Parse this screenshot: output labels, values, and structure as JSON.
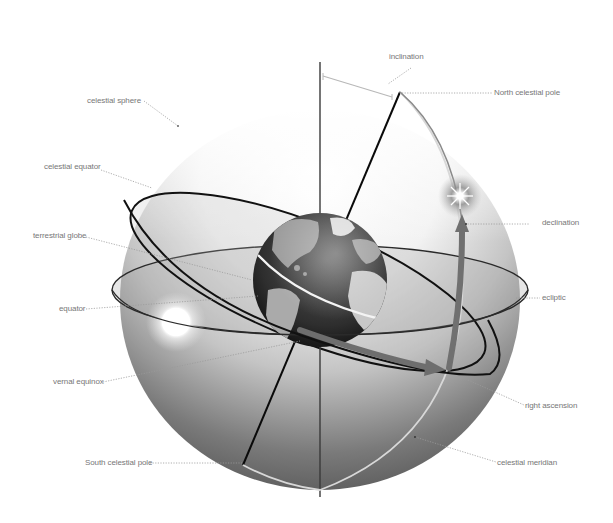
{
  "diagram": {
    "colors": {
      "background": "#ffffff",
      "label_text": "#777777",
      "leader_line": "#9a9a9a",
      "sphere_dark": "#5a5a5a",
      "sphere_light": "#f4f4f4",
      "orbit_line": "#1a1a1a",
      "arrow_fill": "#6e6e6e",
      "meridian": "#d8d8d8"
    },
    "labels": {
      "inclination": "inclination",
      "north_celestial_pole": "North celestial pole",
      "celestial_sphere": "celestial sphere",
      "celestial_equator": "celestial equator",
      "declination": "declination",
      "terrestrial_globe": "terrestrial globe",
      "equator": "equator",
      "ecliptic": "ecliptic",
      "vernal_equinox": "vernal equinox",
      "right_ascension": "right ascension",
      "south_celestial_pole": "South celestial pole",
      "celestial_meridian": "celestial meridian"
    }
  }
}
